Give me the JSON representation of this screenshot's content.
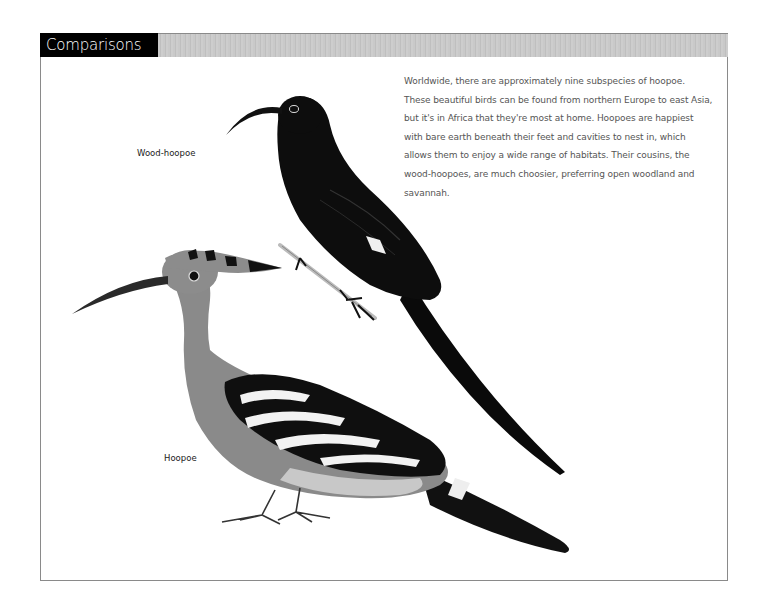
{
  "section": {
    "title": "Comparisons"
  },
  "article": {
    "paragraph": "Worldwide, there are approximately nine subspecies of hoopoe. These beautiful birds can be found from northern Europe to east Asia, but it's in Africa that they're most at home. Hoopoes are happiest with bare earth beneath their feet and cavities to nest in, which allows them to enjoy a wide range of habitats. Their cousins, the wood-hoopoes, are much choosier, preferring open woodland and savannah."
  },
  "illustrations": [
    {
      "label": "Wood-hoopoe",
      "icon": "wood-hoopoe-illustration"
    },
    {
      "label": "Hoopoe",
      "icon": "hoopoe-illustration"
    }
  ],
  "colors": {
    "header_black": "#000000",
    "header_bar": "#c9c9c9",
    "frame_border": "#8a8a8a",
    "text_gray": "#555555"
  }
}
